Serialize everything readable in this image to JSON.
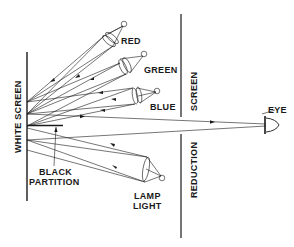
{
  "diagram": {
    "labels": {
      "red": "RED",
      "green": "GREEN",
      "blue": "BLUE",
      "eye": "EYE",
      "screen": "SCREEN",
      "reduction": "REDUCTION",
      "white_screen": "WHITE SCREEN",
      "black": "BLACK",
      "partition": "PARTITION",
      "lamp": "LAMP",
      "light": "LIGHT"
    },
    "colors": {
      "ink": "#1a1a1a",
      "background": "#ffffff"
    }
  }
}
